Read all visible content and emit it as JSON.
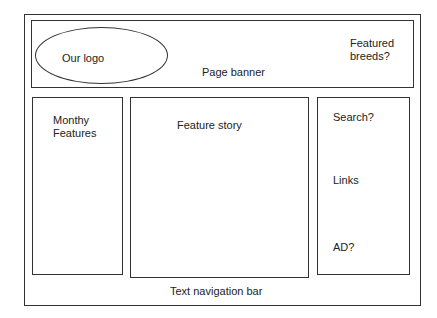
{
  "wireframe": {
    "banner": {
      "logo_label": "Our logo",
      "banner_label": "Page banner",
      "featured_label_line1": "Featured",
      "featured_label_line2": "breeds?"
    },
    "left_column": {
      "label_line1": "Monthy",
      "label_line2": "Features"
    },
    "center_column": {
      "label": "Feature story"
    },
    "right_column": {
      "search_label": "Search?",
      "links_label": "Links",
      "ad_label": "AD?"
    },
    "footer": {
      "nav_label": "Text navigation bar"
    }
  }
}
